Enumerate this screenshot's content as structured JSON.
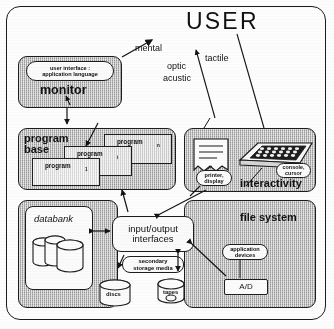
{
  "diagram": {
    "title": "USER",
    "flow_labels": {
      "mental": "mental",
      "optic": "optic",
      "acustic": "acustic",
      "tactile": "tactile"
    },
    "monitor_block": {
      "pill": "user interface :\napplication language",
      "pill_line1": "user interface :",
      "pill_line2": "application language",
      "label": "monitor"
    },
    "program_base": {
      "label_line1": "program",
      "label_line2": "base",
      "programs": [
        {
          "name": "program",
          "index": "n"
        },
        {
          "name": "program",
          "index": "i"
        },
        {
          "name": "program",
          "index": "1"
        }
      ]
    },
    "interactivity": {
      "label": "interactivity",
      "printer_display_line1": "printer,",
      "printer_display_line2": "display",
      "console_cursor_line1": "console,",
      "console_cursor_line2": "cursor"
    },
    "databank": {
      "label": "databank"
    },
    "io": {
      "line1": "input/output",
      "line2": "interfaces"
    },
    "secondary_storage": {
      "line1": "secondary",
      "line2": "storage media",
      "discs": "discs",
      "tapes": "tapes"
    },
    "file_system": {
      "label": "file system",
      "application_devices_line1": "application",
      "application_devices_line2": "devices",
      "ad_label": "A/D"
    },
    "colors": {
      "ink": "#1b1b1b",
      "hatch_fill": "#b9b9b9",
      "paper": "#fdfdfd"
    }
  }
}
